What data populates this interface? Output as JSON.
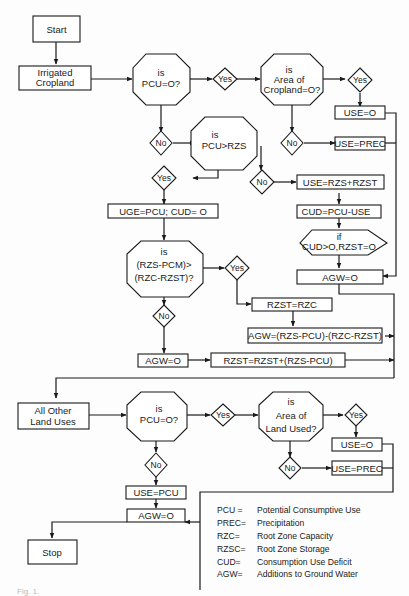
{
  "figure": {
    "caption": "Fig. 1."
  },
  "top_section": {
    "start": "Start",
    "irrigated_cropland": [
      "Irrigated",
      "Cropland"
    ],
    "is_pcu_zero": [
      "is",
      "PCU=O?"
    ],
    "yes_1": "Yes",
    "is_area_cropland_zero": [
      "is",
      "Area   of",
      "Cropland=O?"
    ],
    "yes_2": "Yes",
    "use_zero": "USE=O",
    "no_1": "No",
    "no_2": "No",
    "use_prec": "USE=PREC",
    "is_pcu_gt_rzs": [
      "is",
      "PCU>RZS"
    ],
    "yes_3": "Yes",
    "no_3": "No",
    "use_rzs_rzst": "USE=RZS+RZST",
    "uge_pcu_cud": "UGE=PCU; CUD= O",
    "cud_pcu_use": "CUD=PCU-USE",
    "if_cud": [
      "if",
      "CUD>O,RZST=O"
    ],
    "is_rzs_pcm": [
      "is",
      "(RZS-PCM)>",
      "(RZC-RZST)?"
    ],
    "yes_4": "Yes",
    "agw_zero_right": "AGW=O",
    "rzst_rzc": "RZST=RZC",
    "no_4": "No",
    "agw_formula": "AGW=(RZS-PCU)-(RZC-RZST)",
    "agw_zero_left": "AGW=O",
    "rzst_update": "RZST=RZST+(RZS-PCU)"
  },
  "bottom_section": {
    "all_other_land_uses": [
      "All  Other",
      "Land  Uses"
    ],
    "is_pcu_zero": [
      "is",
      "PCU=O?"
    ],
    "yes_1": "Yes",
    "is_area_land_used": [
      "is",
      "Area of",
      "Land Used?"
    ],
    "yes_2": "Yes",
    "use_zero": "USE=O",
    "no_1": "No",
    "no_2": "No",
    "use_prec": "USE=PREC",
    "use_pcu": "USE=PCU",
    "agw_zero": "AGW=O",
    "stop": "Stop"
  },
  "legend": [
    {
      "abbr": "PCU =",
      "meaning": "Potential  Consumptive  Use"
    },
    {
      "abbr": "PREC=",
      "meaning": "Precipitation"
    },
    {
      "abbr": "RZC=",
      "meaning": "Root  Zone  Capacity"
    },
    {
      "abbr": "RZSC=",
      "meaning": "Root  Zone  Storage"
    },
    {
      "abbr": "CUD=",
      "meaning": "Consumption  Use  Deficit"
    },
    {
      "abbr": "AGW=",
      "meaning": "Additions  to  Ground  Water"
    }
  ]
}
